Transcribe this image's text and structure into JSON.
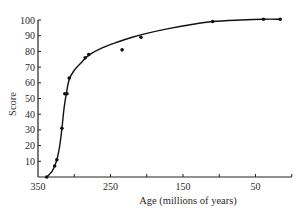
{
  "chart_data": {
    "type": "scatter",
    "title": "",
    "xlabel": "Age (millions of years)",
    "ylabel": "Score",
    "xlim": [
      350,
      0
    ],
    "ylim": [
      0,
      100
    ],
    "x_reversed": true,
    "grid": false,
    "legend": "none",
    "x_ticks": [
      350,
      300,
      250,
      200,
      150,
      100,
      50,
      0
    ],
    "x_tick_labels": [
      "350",
      "",
      "250",
      "",
      "150",
      "",
      "50",
      ""
    ],
    "y_ticks": [
      10,
      20,
      30,
      40,
      50,
      60,
      70,
      80,
      90,
      100
    ],
    "y_tick_labels": [
      "10",
      "20",
      "30",
      "40",
      "50",
      "60",
      "70",
      "80",
      "90",
      "100"
    ],
    "series": [
      {
        "name": "Observed scores",
        "kind": "points",
        "points": [
          {
            "x": 338,
            "y": 0
          },
          {
            "x": 327,
            "y": 7
          },
          {
            "x": 324,
            "y": 11
          },
          {
            "x": 317,
            "y": 31
          },
          {
            "x": 313,
            "y": 53
          },
          {
            "x": 310,
            "y": 53
          },
          {
            "x": 307,
            "y": 63
          },
          {
            "x": 285,
            "y": 76
          },
          {
            "x": 280,
            "y": 78
          },
          {
            "x": 234,
            "y": 81
          },
          {
            "x": 208,
            "y": 89
          },
          {
            "x": 109,
            "y": 99
          },
          {
            "x": 39,
            "y": 100.5
          },
          {
            "x": 16,
            "y": 100.5
          }
        ]
      },
      {
        "name": "Fitted curve",
        "kind": "line",
        "points": [
          {
            "x": 338,
            "y": 0
          },
          {
            "x": 330,
            "y": 4
          },
          {
            "x": 324,
            "y": 11
          },
          {
            "x": 320,
            "y": 20
          },
          {
            "x": 317,
            "y": 31
          },
          {
            "x": 314,
            "y": 44
          },
          {
            "x": 311,
            "y": 53
          },
          {
            "x": 307,
            "y": 62
          },
          {
            "x": 300,
            "y": 68
          },
          {
            "x": 290,
            "y": 73
          },
          {
            "x": 280,
            "y": 77.5
          },
          {
            "x": 260,
            "y": 82.5
          },
          {
            "x": 240,
            "y": 86
          },
          {
            "x": 220,
            "y": 89
          },
          {
            "x": 200,
            "y": 91.5
          },
          {
            "x": 170,
            "y": 94.5
          },
          {
            "x": 140,
            "y": 97
          },
          {
            "x": 109,
            "y": 99
          },
          {
            "x": 70,
            "y": 100
          },
          {
            "x": 39,
            "y": 100.5
          },
          {
            "x": 16,
            "y": 100.5
          }
        ]
      }
    ]
  }
}
